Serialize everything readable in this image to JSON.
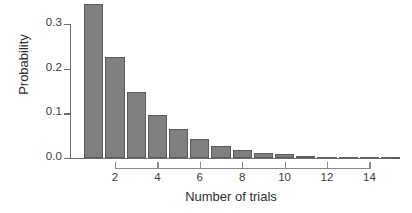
{
  "chart_data": {
    "type": "bar",
    "title": "",
    "xlabel": "Number of trials",
    "ylabel": "Probability",
    "categories": [
      1,
      2,
      3,
      4,
      5,
      6,
      7,
      8,
      9,
      10,
      11,
      12,
      13,
      14,
      15
    ],
    "values": [
      0.345,
      0.226,
      0.148,
      0.097,
      0.064,
      0.042,
      0.027,
      0.018,
      0.012,
      0.008,
      0.005,
      0.003,
      0.002,
      0.0015,
      0.001
    ],
    "xlim": [
      0.4,
      15.6
    ],
    "ylim": [
      0.0,
      0.345
    ],
    "xticks": [
      2,
      4,
      6,
      8,
      10,
      12,
      14
    ],
    "xtick_labels": [
      "2",
      "4",
      "6",
      "8",
      "10",
      "12",
      "14"
    ],
    "yticks": [
      0.0,
      0.1,
      0.2,
      0.3
    ],
    "ytick_labels": [
      "0.0",
      "0.1",
      "0.2",
      "0.3"
    ],
    "grid": false,
    "legend": null,
    "bar_color": "#808080",
    "bar_border_color": "#5c5c5c",
    "axis_color": "#6e6e6e"
  }
}
